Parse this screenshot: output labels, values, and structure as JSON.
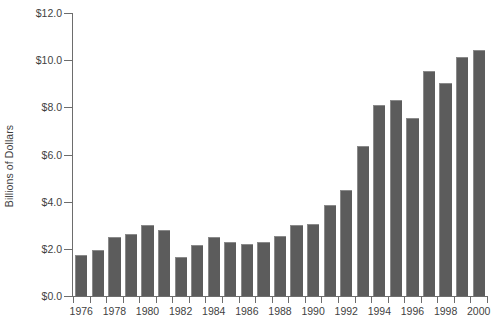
{
  "chart_data": {
    "type": "bar",
    "title": "",
    "xlabel": "",
    "ylabel": "Billions of Dollars",
    "ylim": [
      0.0,
      12.0
    ],
    "ytick_values": [
      0.0,
      2.0,
      4.0,
      6.0,
      8.0,
      10.0,
      12.0
    ],
    "ytick_labels": [
      "$0.0",
      "$2.0",
      "$4.0",
      "$6.0",
      "$8.0",
      "$10.0",
      "$12.0"
    ],
    "grid": false,
    "legend": null,
    "bar_color": "#5c5c5c",
    "axis_color": "#6d6d6d",
    "categories": [
      "1976",
      "1977",
      "1978",
      "1979",
      "1980",
      "1981",
      "1982",
      "1983",
      "1984",
      "1985",
      "1986",
      "1987",
      "1988",
      "1989",
      "1990",
      "1991",
      "1992",
      "1993",
      "1994",
      "1995",
      "1996",
      "1997",
      "1998",
      "1999",
      "2000"
    ],
    "values": [
      1.75,
      1.95,
      2.5,
      2.65,
      3.0,
      2.8,
      1.65,
      2.15,
      2.5,
      2.3,
      2.2,
      2.3,
      2.55,
      3.0,
      3.05,
      3.85,
      4.5,
      6.35,
      8.1,
      8.3,
      7.55,
      9.55,
      9.05,
      10.15,
      10.45
    ],
    "labeled_ticks": [
      "1976",
      "1978",
      "1980",
      "1982",
      "1984",
      "1986",
      "1988",
      "1990",
      "1992",
      "1994",
      "1996",
      "1998",
      "2000"
    ]
  }
}
